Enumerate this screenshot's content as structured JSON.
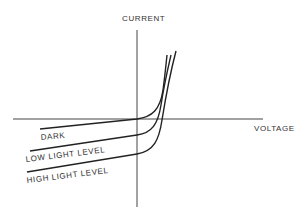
{
  "diagram": {
    "axes": {
      "y_label": "CURRENT",
      "x_label": "VOLTAGE"
    },
    "curves": [
      {
        "label": "DARK"
      },
      {
        "label": "LOW LIGHT LEVEL"
      },
      {
        "label": "HIGH LIGHT LEVEL"
      }
    ]
  }
}
